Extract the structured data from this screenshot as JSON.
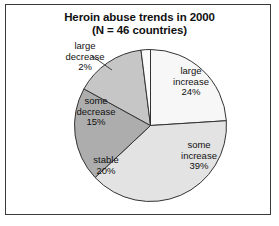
{
  "chart_data": {
    "type": "pie",
    "title": "Heroin abuse trends in 2000",
    "subtitle": "(N = 46 countries)",
    "xlabel": "",
    "ylabel": "",
    "legend_position": "none",
    "grid": false,
    "units": "percent",
    "total_label": "N = 46 countries",
    "start_angle_deg": 0,
    "direction": "clockwise",
    "categories": [
      "large increase",
      "some increase",
      "stable",
      "some decrease",
      "large decrease"
    ],
    "values": [
      24,
      39,
      20,
      15,
      2
    ],
    "value_labels": [
      "24%",
      "39%",
      "20%",
      "15%",
      "2%"
    ],
    "colors": [
      "#f7f7f7",
      "#e3e3e3",
      "#adadad",
      "#c6c6c6",
      "#fbfbfb"
    ],
    "slices": [
      {
        "name": "large increase",
        "value": 24,
        "value_label": "24%",
        "color": "#f7f7f7",
        "label_line1": "large",
        "label_line2": "increase",
        "label_placement": "inside"
      },
      {
        "name": "some increase",
        "value": 39,
        "value_label": "39%",
        "color": "#e3e3e3",
        "label_line1": "some",
        "label_line2": "increase",
        "label_placement": "inside"
      },
      {
        "name": "stable",
        "value": 20,
        "value_label": "20%",
        "color": "#adadad",
        "label_line1": "stable",
        "label_line2": "",
        "label_placement": "inside"
      },
      {
        "name": "some decrease",
        "value": 15,
        "value_label": "15%",
        "color": "#c6c6c6",
        "label_line1": "some",
        "label_line2": "decrease",
        "label_placement": "inside"
      },
      {
        "name": "large decrease",
        "value": 2,
        "value_label": "2%",
        "color": "#fbfbfb",
        "label_line1": "large",
        "label_line2": "decrease",
        "label_placement": "outside"
      }
    ]
  },
  "figure": {
    "border_color": "#3a3a3a",
    "background": "#ffffff",
    "outline_color": "#333333"
  }
}
